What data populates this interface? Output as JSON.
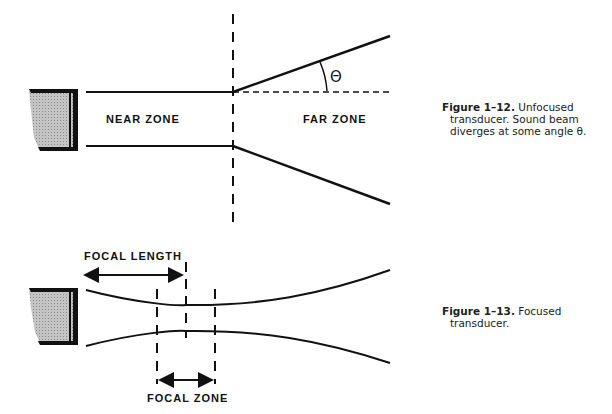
{
  "figure_1_12": {
    "labels": {
      "near_zone": "NEAR ZONE",
      "far_zone": "FAR ZONE",
      "angle": "Θ"
    },
    "caption": {
      "number": "Figure 1–12.",
      "line1": "Unfocused",
      "line2": "transducer. Sound beam",
      "line3": "diverges at some angle θ."
    }
  },
  "figure_1_13": {
    "labels": {
      "focal_length": "FOCAL LENGTH",
      "focal_zone": "FOCAL ZONE"
    },
    "caption": {
      "number": "Figure 1–13.",
      "line1": "Focused",
      "line2": "transducer."
    }
  },
  "colors": {
    "ink": "#111111",
    "transducer_fill": "#b8b8b8",
    "background": "#ffffff"
  }
}
